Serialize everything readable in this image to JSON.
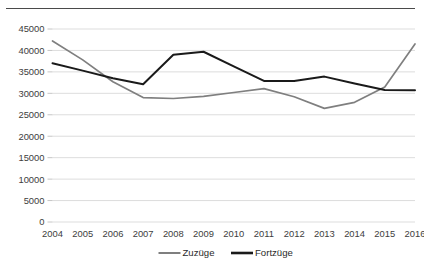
{
  "chart_data": {
    "type": "line",
    "title": "",
    "subtitle": "",
    "xlabel": "",
    "ylabel": "",
    "categories": [
      "2004",
      "2005",
      "2006",
      "2007",
      "2008",
      "2009",
      "2010",
      "2011",
      "2012",
      "2013",
      "2014",
      "2015",
      "2016"
    ],
    "series": [
      {
        "name": "Zuzüge",
        "color": "#7f7f7f",
        "values": [
          42200,
          37800,
          32700,
          29000,
          28800,
          29300,
          30200,
          31100,
          29200,
          26500,
          27900,
          31500,
          41500
        ]
      },
      {
        "name": "Fortzüge",
        "color": "#1a1a1a",
        "values": [
          37000,
          35300,
          33500,
          32100,
          39000,
          39700,
          36300,
          32900,
          32900,
          33900,
          32300,
          30800,
          30700
        ]
      }
    ],
    "ylim": [
      0,
      45000
    ],
    "ytick_step": 5000,
    "yticks": [
      "0",
      "5000",
      "10000",
      "15000",
      "20000",
      "25000",
      "30000",
      "35000",
      "40000",
      "45000"
    ],
    "ytick_values": [
      0,
      5000,
      10000,
      15000,
      20000,
      25000,
      30000,
      35000,
      40000,
      45000
    ],
    "grid": true,
    "grid_color": "#d9d9d9",
    "legend_position": "bottom",
    "legend": [
      "Zuzüge",
      "Fortzüge"
    ]
  },
  "frame": {
    "top_rule_color": "#4a4a4a"
  }
}
